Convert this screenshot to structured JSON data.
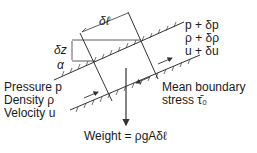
{
  "diagram": {
    "type": "fluid element in inclined channel",
    "dimensions": {
      "length": "δℓ",
      "height": "δz",
      "angle": "α"
    },
    "inlet": {
      "pressure": "Pressure p",
      "density": "Density ρ",
      "velocity": "Velocity u"
    },
    "outlet": {
      "pressure": "p + δp",
      "density": "ρ + δρ",
      "velocity": "u + δu"
    },
    "boundary": {
      "line1": "Mean boundary",
      "line2": "stress τ̄₀"
    },
    "weight": "Weight = ρgAδℓ",
    "colors": {
      "line": "#333333",
      "text": "#1a1a1a",
      "background": "#ffffff"
    }
  }
}
